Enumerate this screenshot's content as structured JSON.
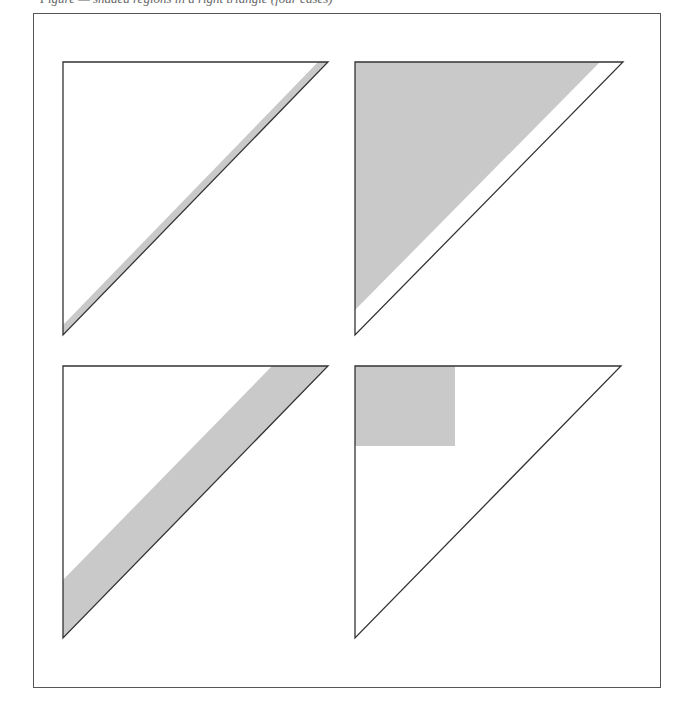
{
  "caption": {
    "text": "Figure — shaded regions in a right triangle (four cases)"
  },
  "colors": {
    "fill": "#c9c9c9",
    "stroke": "#333333",
    "frame": "#555555",
    "background": "#ffffff"
  },
  "panels": [
    {
      "id": "top-left",
      "triangle": [
        [
          63,
          62
        ],
        [
          328,
          62
        ],
        [
          63,
          335
        ]
      ],
      "shaded": {
        "type": "thin-band",
        "points": [
          [
            63,
            325
          ],
          [
            318,
            62
          ],
          [
            328,
            62
          ],
          [
            63,
            335
          ]
        ]
      }
    },
    {
      "id": "top-right",
      "triangle": [
        [
          355,
          62
        ],
        [
          623,
          62
        ],
        [
          355,
          335
        ]
      ],
      "shaded": {
        "type": "inner-triangle",
        "points": [
          [
            355,
            62
          ],
          [
            600,
            62
          ],
          [
            355,
            310
          ]
        ]
      }
    },
    {
      "id": "bottom-left",
      "triangle": [
        [
          63,
          366
        ],
        [
          328,
          366
        ],
        [
          63,
          638
        ]
      ],
      "shaded": {
        "type": "wide-band",
        "points": [
          [
            63,
            580
          ],
          [
            272,
            366
          ],
          [
            328,
            366
          ],
          [
            63,
            638
          ]
        ]
      }
    },
    {
      "id": "bottom-right",
      "triangle": [
        [
          355,
          366
        ],
        [
          621,
          366
        ],
        [
          355,
          638
        ]
      ],
      "shaded": {
        "type": "square",
        "points": [
          [
            355,
            366
          ],
          [
            455,
            366
          ],
          [
            455,
            446
          ],
          [
            355,
            446
          ]
        ]
      }
    }
  ]
}
